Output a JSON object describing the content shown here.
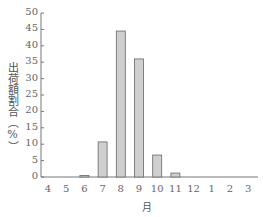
{
  "chart_data": {
    "type": "bar",
    "title": "",
    "xlabel": "月",
    "ylabel": "出荷額割合（%）",
    "categories": [
      "4",
      "5",
      "6",
      "7",
      "8",
      "9",
      "10",
      "11",
      "12",
      "1",
      "2",
      "3"
    ],
    "values": [
      0,
      0,
      0.3,
      10.7,
      44.5,
      36.0,
      6.7,
      1.2,
      0,
      0,
      0,
      0
    ],
    "ylim": [
      0,
      50
    ],
    "yticks": [
      0,
      5,
      10,
      15,
      20,
      25,
      30,
      35,
      40,
      45,
      50
    ],
    "grid": false,
    "legend": null,
    "colors": {
      "bar_fill": "#cfcfcf",
      "bar_stroke": "#666666",
      "axis": "#777777"
    }
  }
}
